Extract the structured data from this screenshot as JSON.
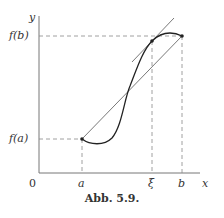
{
  "figure": {
    "caption": "Abb. 5.9.",
    "axes": {
      "y_label": "y",
      "x_label": "x",
      "origin_label": "0"
    },
    "y_ticks": [
      {
        "label": "f(b)",
        "y": 36
      },
      {
        "label": "f(a)",
        "y": 139
      }
    ],
    "x_ticks": [
      {
        "label": "a",
        "x": 82
      },
      {
        "label": "ξ",
        "x": 152
      },
      {
        "label": "b",
        "x": 182
      }
    ],
    "colors": {
      "curve": "#222222",
      "axis": "#777777",
      "dashed": "#888888",
      "text": "#333333"
    }
  }
}
